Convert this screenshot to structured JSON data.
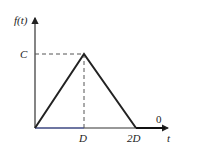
{
  "diagram": {
    "y_label": "f(t)",
    "x_label": "t",
    "peak_label": "C",
    "tick_d": "D",
    "tick_2d": "2D",
    "zero_label": "0",
    "colors": {
      "line": "#222222",
      "axis": "#333333",
      "dash": "#555555"
    }
  }
}
